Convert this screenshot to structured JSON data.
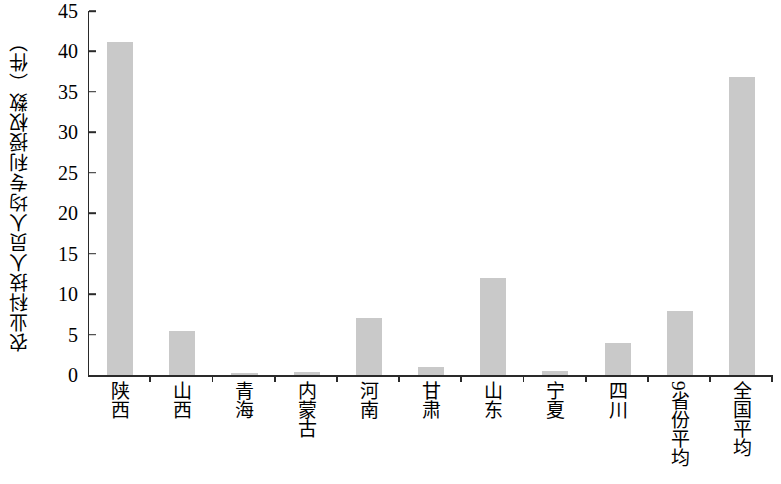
{
  "chart_data": {
    "type": "bar",
    "title": "",
    "xlabel": "",
    "ylabel": "农业科技人员人均专利授权数（件）",
    "ylim": [
      0,
      45
    ],
    "ytick_labels": [
      "45",
      "40",
      "35",
      "30",
      "25",
      "20",
      "15",
      "10",
      "5",
      "0"
    ],
    "ytick_values": [
      45,
      40,
      35,
      30,
      25,
      20,
      15,
      10,
      5,
      0
    ],
    "grid": false,
    "legend": null,
    "bar_color": "#c9c9c9",
    "axis_color": "#2a2a2a",
    "categories": [
      "陕西",
      "山西",
      "青海",
      "内蒙古",
      "河南",
      "甘肃",
      "山东",
      "宁夏",
      "四川",
      "9省份平均",
      "全国平均"
    ],
    "values": [
      41.2,
      5.5,
      0.2,
      0.4,
      7.0,
      1.0,
      12.0,
      0.5,
      4.0,
      7.9,
      36.8
    ]
  }
}
